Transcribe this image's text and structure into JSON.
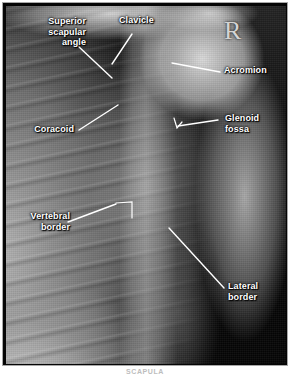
{
  "figure": {
    "modality": "radiograph",
    "view_marker": "R",
    "caption": "SCAPULA",
    "colors": {
      "label_text": "#ffffff",
      "leader_line": "#ffffff",
      "frame_border": "#a8a8a8",
      "film_background": "#050505"
    }
  },
  "labels": [
    {
      "id": "superior-scapular-angle",
      "text": "Superior\nscapular\nangle",
      "align": "right"
    },
    {
      "id": "clavicle",
      "text": "Clavicle",
      "align": "left"
    },
    {
      "id": "acromion",
      "text": "Acromion",
      "align": "left"
    },
    {
      "id": "coracoid",
      "text": "Coracoid",
      "align": "right"
    },
    {
      "id": "glenoid-fossa",
      "text": "Glenoid\nfossa",
      "align": "left"
    },
    {
      "id": "vertebral-border",
      "text": "Vertebral\nborder",
      "align": "right"
    },
    {
      "id": "lateral-border",
      "text": "Lateral\nborder",
      "align": "left"
    }
  ]
}
